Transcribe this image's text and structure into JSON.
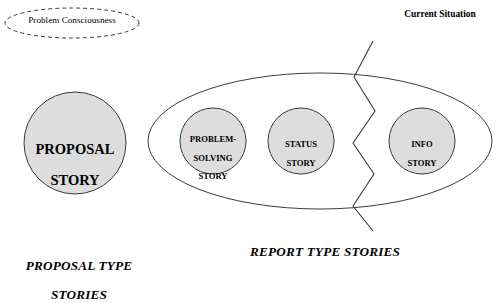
{
  "diagram": {
    "type": "concept-diagram",
    "title_visible": false,
    "background_color": "#ffffff",
    "stroke_color": "#3a3a3a",
    "node_fill_color": "#dddddd",
    "annotations": [
      {
        "id": "problem-consciousness",
        "label": "Problem Consciousness",
        "shape": "dashed-ellipse",
        "cx": 72,
        "cy": 23,
        "rx": 67,
        "ry": 15
      },
      {
        "id": "current-situation",
        "label": "Current Situation",
        "shape": "text",
        "x": 400,
        "y": 20
      }
    ],
    "groups": [
      {
        "id": "proposal-group",
        "caption": "PROPOSAL TYPE\nSTORIES",
        "caption_line1": "PROPOSAL TYPE",
        "caption_line2": "STORIES",
        "caption_x": 74,
        "caption_y": 252,
        "container": null,
        "nodes": [
          {
            "id": "proposal-story",
            "label": "PROPOSAL\nSTORY",
            "label_line1": "PROPOSAL",
            "label_line2": "STORY",
            "shape": "circle",
            "cx": 75,
            "cy": 143,
            "r": 51,
            "fill": "#dddddd"
          }
        ]
      },
      {
        "id": "report-group",
        "caption": "REPORT TYPE STORIES",
        "caption_x": 325,
        "caption_y": 260,
        "container": {
          "id": "report-ellipse",
          "shape": "ellipse",
          "cx": 320,
          "cy": 141,
          "rx": 172,
          "ry": 68,
          "fill": "none"
        },
        "nodes": [
          {
            "id": "problem-solving-story",
            "label": "PROBLEM-\nSOLVING\nSTORY",
            "label_line1": "PROBLEM-",
            "label_line2": "SOLVING",
            "label_line3": "STORY",
            "shape": "circle",
            "cx": 213,
            "cy": 141,
            "r": 33,
            "fill": "#dddddd"
          },
          {
            "id": "status-story",
            "label": "STATUS\nSTORY",
            "label_line1": "STATUS",
            "label_line2": "STORY",
            "shape": "circle",
            "cx": 301,
            "cy": 141,
            "r": 33,
            "fill": "#dddddd"
          },
          {
            "id": "info-story",
            "label": "INFO\nSTORY",
            "label_line1": "INFO",
            "label_line2": "STORY",
            "shape": "circle",
            "cx": 422,
            "cy": 141,
            "r": 33,
            "fill": "#dddddd"
          }
        ]
      }
    ],
    "divider": {
      "id": "zigzag-divider",
      "shape": "zigzag-line",
      "orientation": "vertical",
      "points": "373,41 354,77 375,111 353,143 374,174 353,206 373,231",
      "stroke": "#3a3a3a"
    }
  }
}
